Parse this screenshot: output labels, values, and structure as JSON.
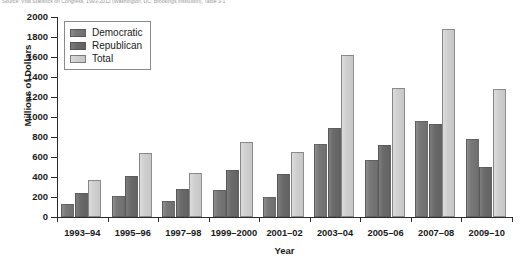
{
  "caption": {
    "text": "Source: Vital Statistics on Congress, 1993-2012 (Washington, DC: Brookings Institution), Table 3-1"
  },
  "chart_data": {
    "type": "bar",
    "title": "",
    "xlabel": "Year",
    "ylabel": "Millions of Dollars",
    "ylim": [
      0,
      2000
    ],
    "ytick_step": 200,
    "yticks": [
      0,
      200,
      400,
      600,
      800,
      1000,
      1200,
      1400,
      1600,
      1800,
      2000
    ],
    "ytick_labels": [
      "0",
      "200",
      "400",
      "600",
      "800",
      "1000",
      "1200",
      "1400",
      "1600",
      "1800",
      "2000"
    ],
    "grid": false,
    "legend_position": "top-left",
    "categories": [
      "1993–94",
      "1995–96",
      "1997–98",
      "1999–2000",
      "2001–02",
      "2003–04",
      "2005–06",
      "2007–08",
      "2009–10"
    ],
    "series": [
      {
        "name": "Democratic",
        "color": "#787878",
        "values": [
          130,
          210,
          160,
          270,
          200,
          730,
          570,
          960,
          780
        ]
      },
      {
        "name": "Republican",
        "color": "#6a6a6a",
        "values": [
          240,
          410,
          280,
          470,
          430,
          890,
          720,
          930,
          500
        ]
      },
      {
        "name": "Total",
        "color": "#cfcfcf",
        "values": [
          370,
          640,
          440,
          750,
          650,
          1620,
          1290,
          1880,
          1280
        ]
      }
    ]
  }
}
